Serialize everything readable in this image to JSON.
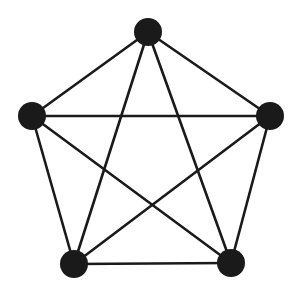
{
  "diagram": {
    "type": "complete-graph",
    "name": "K5",
    "colors": {
      "node": "#1a1a1a",
      "edge": "#1a1a1a",
      "background": "#ffffff"
    },
    "node_radius": 14,
    "edge_width": 2.6,
    "nodes": [
      {
        "id": "top",
        "x": 148,
        "y": 32
      },
      {
        "id": "left",
        "x": 32,
        "y": 116
      },
      {
        "id": "right",
        "x": 270,
        "y": 116
      },
      {
        "id": "bottom-left",
        "x": 74,
        "y": 264
      },
      {
        "id": "bottom-right",
        "x": 231,
        "y": 263
      }
    ],
    "edges": [
      [
        "top",
        "left"
      ],
      [
        "top",
        "right"
      ],
      [
        "top",
        "bottom-left"
      ],
      [
        "top",
        "bottom-right"
      ],
      [
        "left",
        "right"
      ],
      [
        "left",
        "bottom-left"
      ],
      [
        "left",
        "bottom-right"
      ],
      [
        "right",
        "bottom-left"
      ],
      [
        "right",
        "bottom-right"
      ],
      [
        "bottom-left",
        "bottom-right"
      ]
    ]
  }
}
